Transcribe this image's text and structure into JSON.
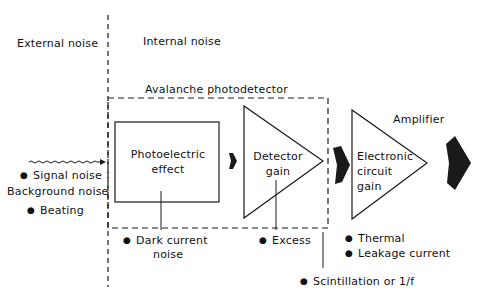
{
  "regions": {
    "external": "External noise",
    "internal": "Internal noise"
  },
  "avalanche_box": {
    "title": "Avalanche photodetector"
  },
  "blocks": {
    "photoelectric": {
      "line1": "Photoelectric",
      "line2": "effect"
    },
    "detector": {
      "line1": "Detector",
      "line2": "gain"
    },
    "amplifier": {
      "title": "Amplifier",
      "line1": "Electronic",
      "line2": "circuit",
      "line3": "gain"
    }
  },
  "external_sources": {
    "signal": "Signal noise",
    "background": "Background noise",
    "beating": "Beating"
  },
  "internal_sources": {
    "dark_current_1": "Dark current",
    "dark_current_2": "noise",
    "excess": "Excess",
    "thermal": "Thermal",
    "leakage": "Leakage current",
    "scintillation": "Scintillation or  1/f"
  },
  "colors": {
    "line": "#1a1a1a",
    "background": "#ffffff"
  }
}
